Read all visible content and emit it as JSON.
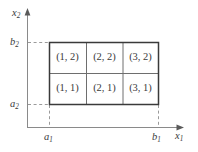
{
  "figure": {
    "background_color": "#ffffff",
    "line_color": "#3a3a3a",
    "inner_line_color": "#6e6e6e",
    "dashed_color": "#9a9a9a",
    "axis_color": "#8a8a8a"
  },
  "axes": {
    "x": {
      "label_base": "x",
      "label_sub": "1",
      "label": "x1"
    },
    "y": {
      "label_base": "x",
      "label_sub": "2",
      "label": "x2"
    }
  },
  "ticks": {
    "x_lower": {
      "base": "a",
      "sub": "1"
    },
    "x_upper": {
      "base": "b",
      "sub": "1"
    },
    "y_lower": {
      "base": "a",
      "sub": "2"
    },
    "y_upper": {
      "base": "b",
      "sub": "2"
    }
  },
  "grid": {
    "columns": 3,
    "rows": 2,
    "cells": [
      {
        "label": "(1, 2)",
        "col": 1,
        "row": 2
      },
      {
        "label": "(2, 2)",
        "col": 2,
        "row": 2
      },
      {
        "label": "(3, 2)",
        "col": 3,
        "row": 2
      },
      {
        "label": "(1, 1)",
        "col": 1,
        "row": 1
      },
      {
        "label": "(2, 1)",
        "col": 2,
        "row": 1
      },
      {
        "label": "(3, 1)",
        "col": 3,
        "row": 1
      }
    ]
  }
}
